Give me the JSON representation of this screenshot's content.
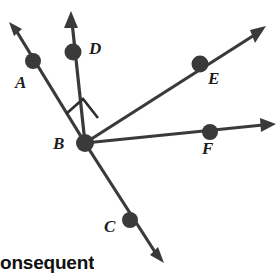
{
  "figure": {
    "type": "geometry-ray-diagram",
    "vertex_label": "B",
    "background_color": "#ffffff",
    "stroke_color": "#3a3a3a",
    "label_color": "#1c1c1c"
  },
  "vertex": {
    "name": "B",
    "label": "B",
    "x": 85,
    "y": 143,
    "label_x": 53,
    "label_y": 135
  },
  "rays": [
    {
      "id": "ray-ba",
      "label": "A",
      "dot_x": 33,
      "dot_y": 61,
      "tip_x": 9,
      "tip_y": 22,
      "label_x": 15,
      "label_y": 74
    },
    {
      "id": "ray-bd",
      "label": "D",
      "dot_x": 73,
      "dot_y": 52,
      "tip_x": 71,
      "tip_y": 11,
      "label_x": 89,
      "label_y": 40
    },
    {
      "id": "ray-be",
      "label": "E",
      "dot_x": 200,
      "dot_y": 64,
      "tip_x": 266,
      "tip_y": 26,
      "label_x": 208,
      "label_y": 70
    },
    {
      "id": "ray-bf",
      "label": "F",
      "dot_x": 210,
      "dot_y": 132,
      "tip_x": 276,
      "tip_y": 124,
      "label_x": 202,
      "label_y": 140
    },
    {
      "id": "ray-bc",
      "label": "C",
      "dot_x": 130,
      "dot_y": 220,
      "tip_x": 164,
      "tip_y": 263,
      "label_x": 104,
      "label_y": 218
    }
  ],
  "right_angle_mark": {
    "present": true,
    "between": [
      "ray-ba",
      "ray-bd"
    ],
    "measure": "90",
    "path": "M 66,114 L 83,99 L 98,118"
  },
  "caption": {
    "text": "onsequent",
    "note": "partial bold word clipped at the bottom edge of the image"
  }
}
